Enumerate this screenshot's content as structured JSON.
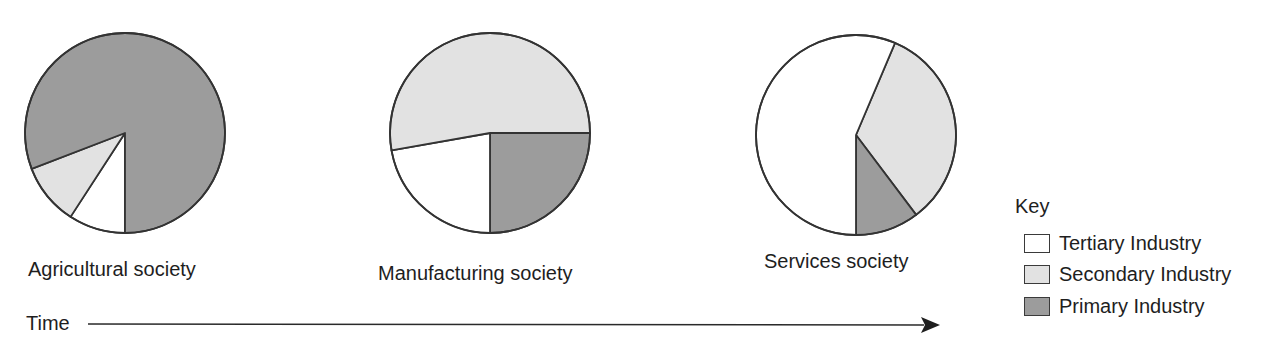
{
  "colors": {
    "tertiary": "#ffffff",
    "secondary": "#e2e2e2",
    "primary": "#9c9c9c",
    "outline": "#333333"
  },
  "pies": [
    {
      "label": "Agricultural society",
      "cx": 125,
      "cy": 133,
      "r": 100,
      "label_x": 28,
      "label_y": 259
    },
    {
      "label": "Manufacturing society",
      "cx": 490,
      "cy": 133,
      "r": 100,
      "label_x": 378,
      "label_y": 263
    },
    {
      "label": "Services society",
      "cx": 856,
      "cy": 135,
      "r": 100,
      "label_x": 764,
      "label_y": 251
    }
  ],
  "legend": {
    "title": "Key",
    "items": [
      {
        "label": "Tertiary Industry",
        "key": "tertiary"
      },
      {
        "label": "Secondary Industry",
        "key": "secondary"
      },
      {
        "label": "Primary Industry",
        "key": "primary"
      }
    ]
  },
  "axis": {
    "label": "Time"
  },
  "chart_data": {
    "type": "pie",
    "title": "",
    "xlabel": "Time",
    "categories": [
      "Agricultural society",
      "Manufacturing society",
      "Services society"
    ],
    "series": [
      {
        "name": "Tertiary Industry",
        "values": [
          9,
          22,
          57
        ]
      },
      {
        "name": "Secondary Industry",
        "values": [
          10,
          53,
          33
        ]
      },
      {
        "name": "Primary Industry",
        "values": [
          81,
          25,
          10
        ]
      }
    ],
    "slices_deg_clockwise_from_top": [
      [
        {
          "series": "Tertiary Industry",
          "start": 180,
          "end": 213
        },
        {
          "series": "Secondary Industry",
          "start": 213,
          "end": 249
        },
        {
          "series": "Primary Industry",
          "start": 249,
          "end": 540
        }
      ],
      [
        {
          "series": "Primary Industry",
          "start": 90,
          "end": 180
        },
        {
          "series": "Tertiary Industry",
          "start": 180,
          "end": 260
        },
        {
          "series": "Secondary Industry",
          "start": 260,
          "end": 450
        }
      ],
      [
        {
          "series": "Secondary Industry",
          "start": 23,
          "end": 143
        },
        {
          "series": "Primary Industry",
          "start": 143,
          "end": 180
        },
        {
          "series": "Tertiary Industry",
          "start": 180,
          "end": 383
        }
      ]
    ],
    "legend_position": "right",
    "legend_title": "Key",
    "grid": false
  }
}
